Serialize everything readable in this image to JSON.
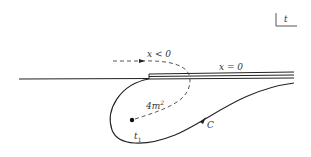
{
  "diagram": {
    "plane_label": "t",
    "labels": {
      "x_negative": "x < 0",
      "x_zero": "x = 0",
      "threshold": "4m",
      "threshold_exp": "2",
      "point": "t",
      "point_sub": "1",
      "contour": "C"
    },
    "colors": {
      "line": "#222222",
      "background": "#ffffff"
    }
  }
}
